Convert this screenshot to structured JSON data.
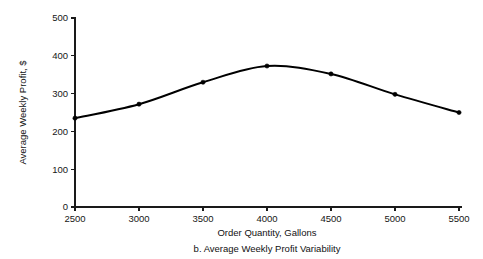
{
  "chart_data": {
    "type": "line",
    "title": "",
    "caption": "b. Average Weekly Profit Variability",
    "xlabel": "Order Quantity, Gallons",
    "ylabel": "Average Weekly Profit, $",
    "x": [
      2500,
      3000,
      3500,
      4000,
      4500,
      5000,
      5500
    ],
    "values": [
      235,
      272,
      330,
      373,
      352,
      298,
      250
    ],
    "series": [
      {
        "name": "Average Weekly Profit",
        "values": [
          235,
          272,
          330,
          373,
          352,
          298,
          250
        ]
      }
    ],
    "xticks": [
      2500,
      3000,
      3500,
      4000,
      4500,
      5000,
      5500
    ],
    "xtick_labels": [
      "2500",
      "3000",
      "3500",
      "4000",
      "4500",
      "5000",
      "5500"
    ],
    "yticks": [
      0,
      100,
      200,
      300,
      400,
      500
    ],
    "ytick_labels": [
      "0",
      "100",
      "200",
      "300",
      "400",
      "500"
    ],
    "xlim": [
      2500,
      5500
    ],
    "ylim": [
      0,
      500
    ],
    "grid": false,
    "legend": false,
    "legend_position": "none",
    "line_color": "#000000",
    "marker_color": "#000000",
    "background_color": "#ffffff"
  },
  "figure": {
    "x_axis_title": "Order Quantity, Gallons",
    "y_axis_title": "Average Weekly Profit, $",
    "caption": "b. Average Weekly Profit Variability"
  }
}
